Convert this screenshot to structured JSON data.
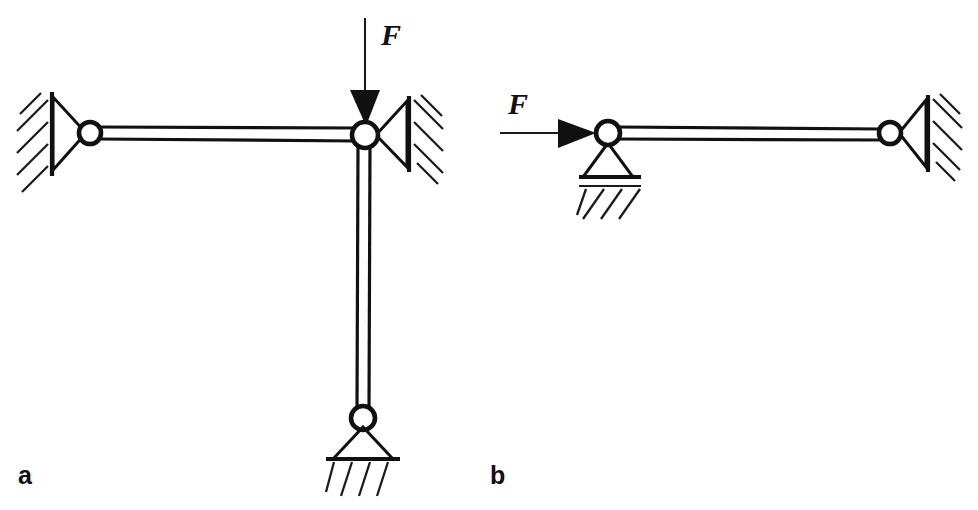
{
  "figure": {
    "background_color": "#ffffff",
    "ink_color": "#111111",
    "width": 978,
    "height": 510
  },
  "panels": [
    {
      "id": "a",
      "label": "a",
      "label_position": {
        "x": 18,
        "y": 484
      },
      "description": "T-shaped two-link mechanism with vertical downward force F applied at the central joint",
      "force": {
        "name": "F",
        "label": "F",
        "direction": "down",
        "label_position": {
          "x": 381,
          "y": 45
        },
        "tail": {
          "x": 365,
          "y": 18
        },
        "tip": {
          "x": 365,
          "y": 126
        }
      },
      "joints": [
        {
          "name": "left-joint",
          "cx": 90,
          "cy": 133,
          "r": 11
        },
        {
          "name": "center-joint",
          "cx": 365,
          "cy": 135,
          "r": 13
        },
        {
          "name": "bottom-joint",
          "cx": 363,
          "cy": 418,
          "r": 12
        }
      ],
      "links": [
        {
          "name": "horizontal-link",
          "from": "left-joint",
          "to": "center-joint",
          "orientation": "horizontal"
        },
        {
          "name": "vertical-link",
          "from": "center-joint",
          "to": "bottom-joint",
          "orientation": "vertical"
        }
      ],
      "supports": [
        {
          "name": "left-wall-pin-support",
          "type": "pin-on-vertical-wall",
          "side": "left",
          "wall_x": 52,
          "wall_top": 92,
          "wall_bottom": 176
        },
        {
          "name": "right-wall-pin-support",
          "type": "pin-on-vertical-wall",
          "side": "right",
          "wall_x": 409,
          "wall_top": 96,
          "wall_bottom": 172
        },
        {
          "name": "bottom-ground-pin-support",
          "type": "pin-on-ground",
          "side": "bottom",
          "ground_y": 459
        }
      ]
    },
    {
      "id": "b",
      "label": "b",
      "label_position": {
        "x": 490,
        "y": 484
      },
      "description": "Single horizontal link with horizontal force F applied at the left joint, pin support below left joint and pin support at right wall",
      "force": {
        "name": "F",
        "label": "F",
        "direction": "right",
        "label_position": {
          "x": 508,
          "y": 114
        },
        "tail": {
          "x": 500,
          "y": 133
        },
        "tip": {
          "x": 596,
          "y": 133
        }
      },
      "joints": [
        {
          "name": "left-joint",
          "cx": 608,
          "cy": 133,
          "r": 12
        },
        {
          "name": "right-joint",
          "cx": 890,
          "cy": 133,
          "r": 11
        }
      ],
      "links": [
        {
          "name": "horizontal-link",
          "from": "left-joint",
          "to": "right-joint",
          "orientation": "horizontal"
        }
      ],
      "supports": [
        {
          "name": "left-ground-pin-support",
          "type": "pin-on-ground",
          "side": "bottom",
          "ground_y": 177
        },
        {
          "name": "right-wall-pin-support",
          "type": "pin-on-vertical-wall",
          "side": "right",
          "wall_x": 928,
          "wall_top": 95,
          "wall_bottom": 172
        }
      ]
    }
  ]
}
